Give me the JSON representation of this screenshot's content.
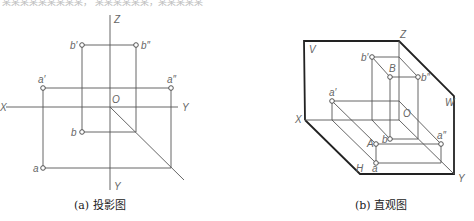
{
  "top_text": "某某某某某某某某某，  某某某某某某，某某某某某",
  "left_diagram": {
    "caption": "(a) 投影图",
    "labels": {
      "Z": "Z",
      "X": "X",
      "Y_right": "Y",
      "Y_bottom": "Y",
      "O": "O",
      "a_prime": "a′",
      "a_dprime": "a″",
      "a": "a",
      "b_prime": "b′",
      "b_dprime": "b″",
      "b": "b"
    }
  },
  "right_diagram": {
    "caption": "(b) 直观图",
    "labels": {
      "V": "V",
      "Z": "Z",
      "W": "W",
      "X": "X",
      "Y": "Y",
      "H": "H",
      "O": "O",
      "a_prime": "a′",
      "A": "A",
      "a": "a",
      "a_dprime": "a″",
      "b_prime": "b′",
      "B": "B",
      "b_dprime": "b″",
      "b": "b"
    }
  }
}
